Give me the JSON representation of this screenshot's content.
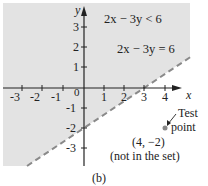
{
  "figure": {
    "caption": "(b)",
    "axes": {
      "x_label": "x",
      "y_label": "y",
      "x_ticks": [
        "-3",
        "-2",
        "-1",
        "0",
        "1",
        "2",
        "3",
        "4"
      ],
      "y_ticks_pos": [
        "1",
        "2",
        "3"
      ],
      "y_ticks_neg": [
        "-1",
        "-2",
        "-3"
      ]
    },
    "inequality_label": "2x − 3y < 6",
    "boundary_label": "2x − 3y = 6",
    "test_point": {
      "label_line1": "Test",
      "label_line2": "point",
      "coords": "(4, −2)",
      "note": "(not in the set)"
    },
    "colors": {
      "shade": "#e3e3e3",
      "line": "#8a8a8a",
      "axis": "#222222",
      "point": "#888888"
    }
  }
}
